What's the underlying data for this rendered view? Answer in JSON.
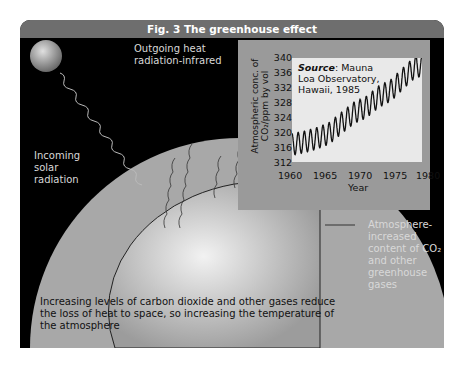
{
  "figure": {
    "title": "Fig. 3  The greenhouse effect"
  },
  "labels": {
    "outgoing": [
      "Outgoing heat",
      "radiation-infrared"
    ],
    "incoming": [
      "Incoming",
      "solar",
      "radiation"
    ],
    "atmosphere": [
      "Atmosphere-",
      "increased",
      "content of CO₂",
      "and other",
      "greenhouse",
      "gases"
    ],
    "caption": [
      "Increasing levels of carbon dioxide and other gases reduce",
      "the loss of heat to space, so increasing the temperature of",
      "the atmosphere"
    ]
  },
  "chart_data": {
    "type": "line",
    "title": "",
    "source_label": "Source",
    "source_text": [
      ": Mauna",
      "Loa Observatory,",
      "Hawaii, 1985"
    ],
    "xlabel": "Year",
    "ylabel": "Atmospheric conc. of CO₂/ppm by vol",
    "xticks": [
      "1960",
      "1965",
      "1970",
      "1975",
      "1980"
    ],
    "yticks": [
      "340",
      "336",
      "332",
      "328",
      "324",
      "320",
      "316",
      "312"
    ],
    "xlim": [
      1959,
      1981
    ],
    "ylim": [
      312,
      341
    ],
    "series": [
      {
        "name": "CO2 (seasonal)",
        "x": [
          1960,
          1962,
          1964,
          1966,
          1968,
          1970,
          1972,
          1974,
          1976,
          1978,
          1980
        ],
        "values": [
          316.9,
          317.6,
          318.6,
          320.0,
          322.9,
          325.7,
          327.3,
          330.2,
          332.0,
          335.4,
          338.7
        ]
      }
    ],
    "seasonal_amplitude": 6,
    "grid": false
  },
  "colors": {
    "header": "#6e6e6e",
    "background": "#000000",
    "atmosphere": "#a8a8a8",
    "chart_panel": "#9a9a9a"
  }
}
